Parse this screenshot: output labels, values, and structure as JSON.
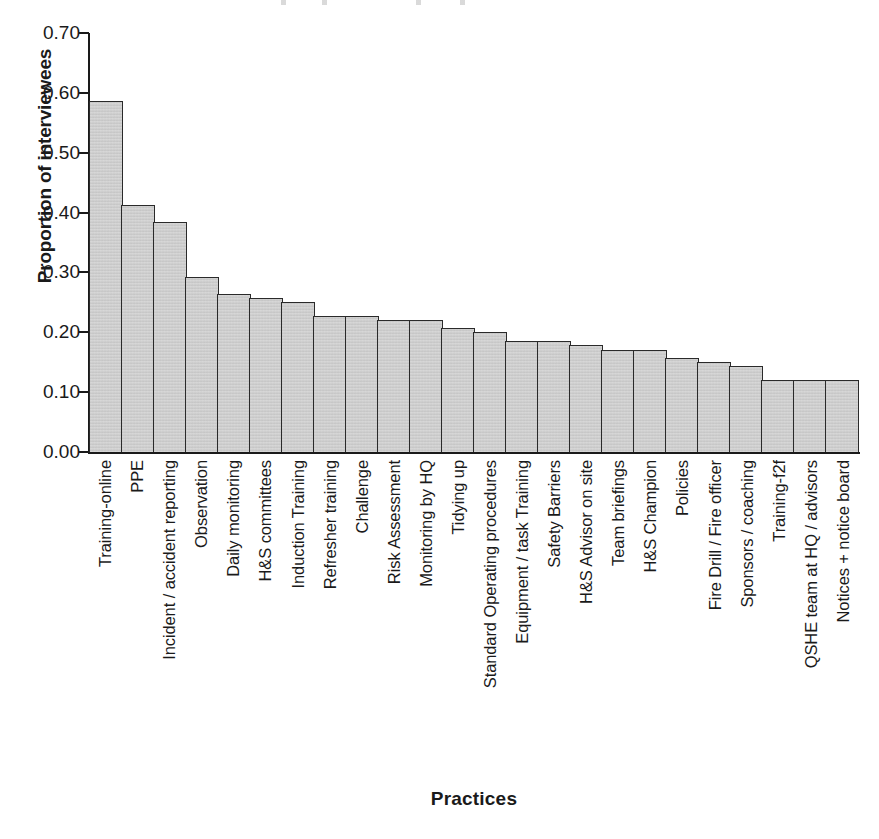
{
  "chart_data": {
    "type": "bar",
    "title": "",
    "xlabel": "Practices",
    "ylabel": "Proportion of interviewees",
    "ylim": [
      0.0,
      0.7
    ],
    "yticks": [
      "0.00",
      "0.10",
      "0.20",
      "0.30",
      "0.40",
      "0.50",
      "0.60",
      "0.70"
    ],
    "ytick_values": [
      0.0,
      0.1,
      0.2,
      0.3,
      0.4,
      0.5,
      0.6,
      0.7
    ],
    "grid": false,
    "legend": null,
    "bar_color": "#cdcdcd",
    "bar_border_color": "#2a2a2a",
    "categories": [
      "Training-online",
      "PPE",
      "Incident / accident reporting",
      "Observation",
      "Daily monitoring",
      "H&S committees",
      "Induction Training",
      "Refresher training",
      "Challenge",
      "Risk Assessment",
      "Monitoring by HQ",
      "Tidying up",
      "Standard Operating procedures",
      "Equipment / task Training",
      "Safety Barriers",
      "H&S Advisor on site",
      "Team briefings",
      "H&S Champion",
      "Policies",
      "Fire Drill / Fire officer",
      "Sponsors / coaching",
      "Training-f2f",
      "QSHE team at HQ / advisors",
      "Notices + notice board"
    ],
    "values": [
      0.587,
      0.412,
      0.385,
      0.293,
      0.264,
      0.257,
      0.25,
      0.228,
      0.228,
      0.221,
      0.221,
      0.207,
      0.2,
      0.186,
      0.186,
      0.178,
      0.171,
      0.171,
      0.157,
      0.15,
      0.143,
      0.121,
      0.121,
      0.121
    ]
  }
}
